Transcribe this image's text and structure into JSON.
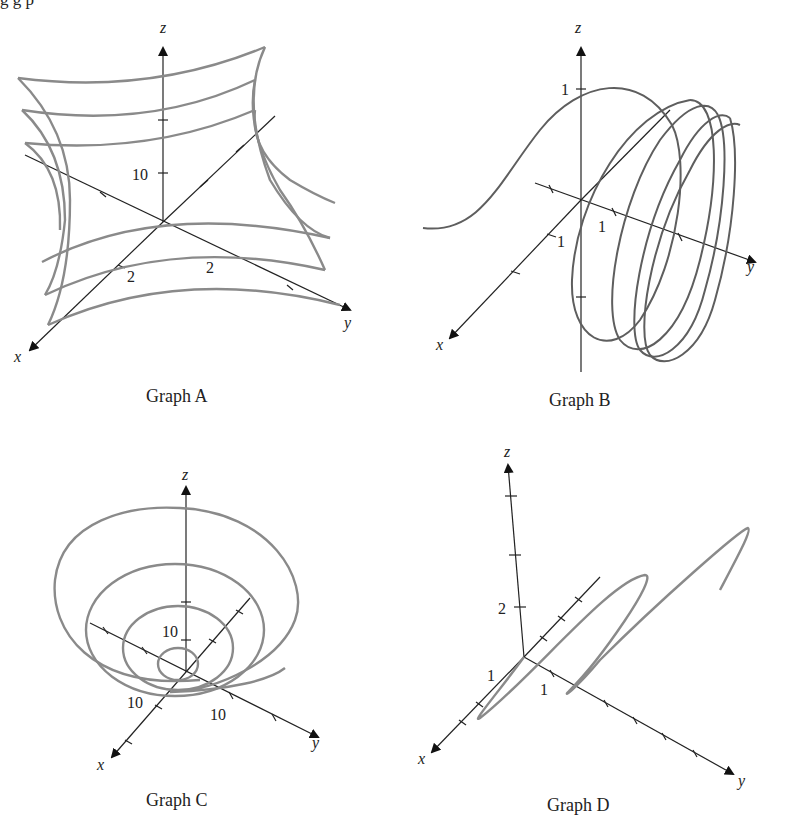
{
  "header": {
    "cut_text": "g    g p"
  },
  "graphs": [
    {
      "caption": "Graph A",
      "axes": {
        "x": "x",
        "y": "y",
        "z": "z"
      },
      "tick_labels": {
        "z": "10",
        "x": "2",
        "y": "2"
      }
    },
    {
      "caption": "Graph B",
      "axes": {
        "x": "x",
        "y": "y",
        "z": "z"
      },
      "tick_labels": {
        "z": "1",
        "x": "1",
        "y": "1"
      }
    },
    {
      "caption": "Graph C",
      "axes": {
        "x": "x",
        "y": "y",
        "z": "z"
      },
      "tick_labels": {
        "z": "10",
        "x": "10",
        "y": "10"
      }
    },
    {
      "caption": "Graph D",
      "axes": {
        "x": "x",
        "y": "y",
        "z": "z"
      },
      "tick_labels": {
        "z": "2",
        "x": "1",
        "y": "1"
      }
    }
  ]
}
